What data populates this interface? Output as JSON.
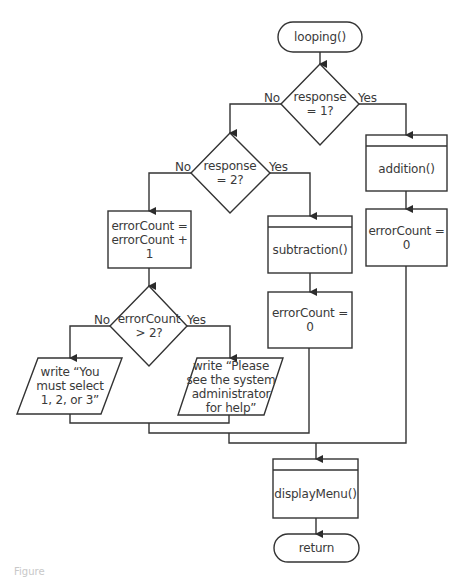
{
  "diagram": {
    "type": "flowchart",
    "stroke_color": "#333333",
    "text_color": "#3a3a3a",
    "background": "#ffffff",
    "nodes": {
      "start": {
        "shape": "terminator",
        "text": "looping()"
      },
      "decision1": {
        "shape": "diamond",
        "text": "response\n= 1?"
      },
      "decision2": {
        "shape": "diamond",
        "text": "response\n= 2?"
      },
      "increment": {
        "shape": "process",
        "text": "errorCount =\nerrorCount + 1"
      },
      "decision3": {
        "shape": "diamond",
        "text": "errorCount\n> 2?"
      },
      "write_select": {
        "shape": "io",
        "text": "write “You\nmust select\n1, 2, or 3”"
      },
      "write_admin": {
        "shape": "io",
        "text": "write “Please\nsee the system\nadministrator\nfor help”"
      },
      "subtraction": {
        "shape": "predefined-process",
        "text": "subtraction()"
      },
      "reset_mid": {
        "shape": "process",
        "text": "errorCount = 0"
      },
      "addition": {
        "shape": "predefined-process",
        "text": "addition()"
      },
      "reset_right": {
        "shape": "process",
        "text": "errorCount = 0"
      },
      "display_menu": {
        "shape": "predefined-process",
        "text": "displayMenu()"
      },
      "end": {
        "shape": "terminator",
        "text": "return"
      }
    },
    "edge_labels": {
      "d1_no": "No",
      "d1_yes": "Yes",
      "d2_no": "No",
      "d2_yes": "Yes",
      "d3_no": "No",
      "d3_yes": "Yes"
    },
    "edges": [
      {
        "from": "start",
        "to": "decision1"
      },
      {
        "from": "decision1",
        "to": "decision2",
        "label": "No"
      },
      {
        "from": "decision1",
        "to": "addition",
        "label": "Yes"
      },
      {
        "from": "decision2",
        "to": "increment",
        "label": "No"
      },
      {
        "from": "decision2",
        "to": "subtraction",
        "label": "Yes"
      },
      {
        "from": "increment",
        "to": "decision3"
      },
      {
        "from": "decision3",
        "to": "write_select",
        "label": "No"
      },
      {
        "from": "decision3",
        "to": "write_admin",
        "label": "Yes"
      },
      {
        "from": "subtraction",
        "to": "reset_mid"
      },
      {
        "from": "addition",
        "to": "reset_right"
      },
      {
        "from": "write_select",
        "to": "display_menu"
      },
      {
        "from": "write_admin",
        "to": "display_menu"
      },
      {
        "from": "reset_mid",
        "to": "display_menu"
      },
      {
        "from": "reset_right",
        "to": "display_menu"
      },
      {
        "from": "display_menu",
        "to": "end"
      }
    ]
  },
  "caption": "Figure"
}
